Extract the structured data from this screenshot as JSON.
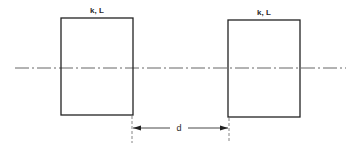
{
  "diagram": {
    "type": "two-element schematic with shared axis",
    "elements": [
      {
        "id": "element-left",
        "label": "k, L"
      },
      {
        "id": "element-right",
        "label": "k, L"
      }
    ],
    "axis": {
      "style": "dash-dot centerline"
    },
    "dimension": {
      "label": "d",
      "meaning": "spacing between inner faces of the two elements"
    }
  }
}
